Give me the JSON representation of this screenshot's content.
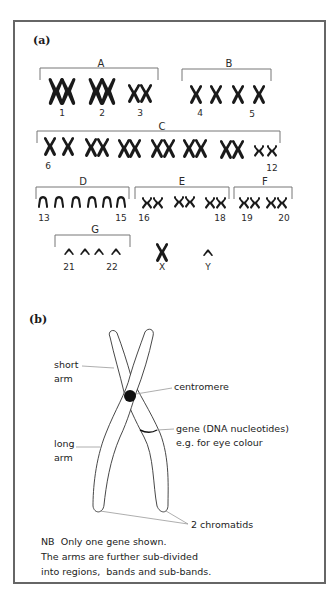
{
  "figure": {
    "panel_a": {
      "label": "(a)",
      "groups": [
        {
          "name": "A",
          "labels": [
            {
              "text": "1"
            },
            {
              "text": "2"
            },
            {
              "text": "3"
            }
          ]
        },
        {
          "name": "B",
          "labels": [
            {
              "text": "4"
            },
            {
              "text": "5"
            }
          ]
        },
        {
          "name": "C",
          "labels": [
            {
              "text": "6"
            },
            {
              "text": "12"
            }
          ]
        },
        {
          "name": "D",
          "labels": [
            {
              "text": "13"
            },
            {
              "text": "15"
            }
          ]
        },
        {
          "name": "E",
          "labels": [
            {
              "text": "16"
            },
            {
              "text": "18"
            }
          ]
        },
        {
          "name": "F",
          "labels": [
            {
              "text": "19"
            },
            {
              "text": "20"
            }
          ]
        },
        {
          "name": "G",
          "labels": [
            {
              "text": "21"
            },
            {
              "text": "22"
            }
          ]
        }
      ],
      "sex_chromosomes": [
        {
          "text": "X"
        },
        {
          "text": "Y"
        }
      ]
    },
    "panel_b": {
      "label": "(b)",
      "annotations": {
        "short_arm": [
          "short",
          "arm"
        ],
        "long_arm": [
          "long",
          "arm"
        ],
        "centromere": "centromere",
        "gene": [
          "gene (DNA nucleotides)",
          "e.g. for eye colour"
        ],
        "chromatids": "2 chromatids"
      },
      "note": [
        "NB  Only one gene shown.",
        "The arms are further sub-divided",
        "into regions,  bands and sub-bands."
      ]
    }
  }
}
